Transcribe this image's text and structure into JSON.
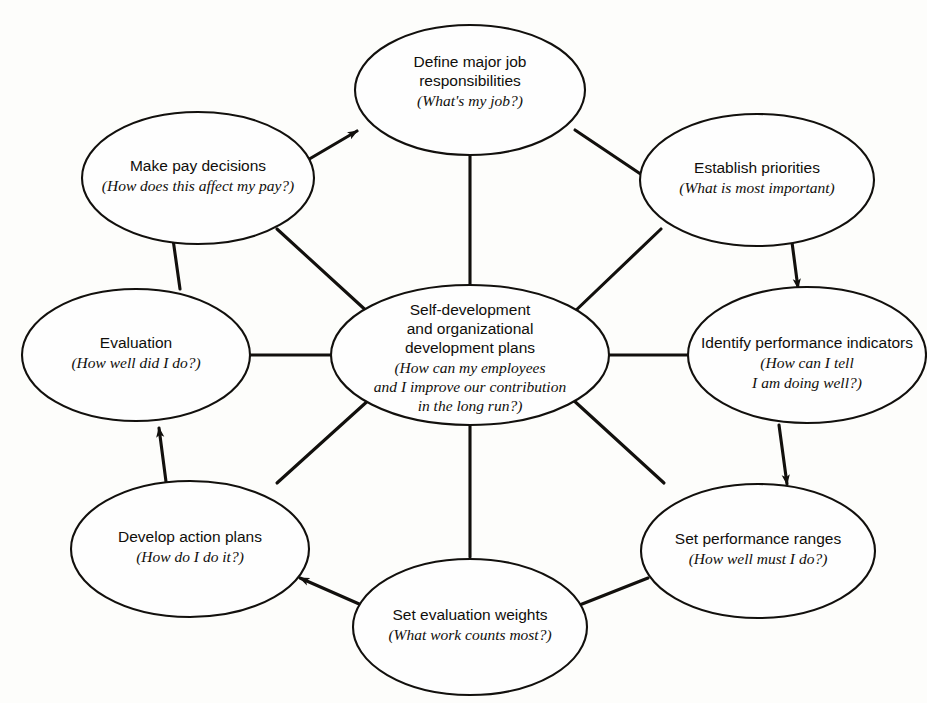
{
  "diagram": {
    "type": "cycle-with-hub",
    "flow_direction": "clockwise",
    "background_color": "#fdfdfb",
    "line_color": "#12100d",
    "hub": {
      "id": "self-development-plans",
      "title_lines": [
        "Self-development",
        "and organizational",
        "development plans"
      ],
      "question_lines": [
        "(How can my employees",
        "and I improve our contribution",
        "in the long run?)"
      ]
    },
    "nodes": [
      {
        "id": "define-major-job-responsibilities",
        "position": "top",
        "title_lines": [
          "Define major job",
          "responsibilities"
        ],
        "question_lines": [
          "(What's my job?)"
        ]
      },
      {
        "id": "establish-priorities",
        "position": "top-right",
        "title_lines": [
          "Establish priorities"
        ],
        "question_lines": [
          "(What is most important)"
        ]
      },
      {
        "id": "identify-performance-indicators",
        "position": "right",
        "title_lines": [
          "Identify performance indicators"
        ],
        "question_lines": [
          "(How can I tell",
          "I am doing well?)"
        ]
      },
      {
        "id": "set-performance-ranges",
        "position": "bottom-right",
        "title_lines": [
          "Set performance ranges"
        ],
        "question_lines": [
          "(How well must I do?)"
        ]
      },
      {
        "id": "set-evaluation-weights",
        "position": "bottom",
        "title_lines": [
          "Set evaluation weights"
        ],
        "question_lines": [
          "(What work counts most?)"
        ]
      },
      {
        "id": "develop-action-plans",
        "position": "bottom-left",
        "title_lines": [
          "Develop action plans"
        ],
        "question_lines": [
          "(How do I do it?)"
        ]
      },
      {
        "id": "evaluation",
        "position": "left",
        "title_lines": [
          "Evaluation"
        ],
        "question_lines": [
          "(How well did I do?)"
        ]
      },
      {
        "id": "make-pay-decisions",
        "position": "top-left",
        "title_lines": [
          "Make pay decisions"
        ],
        "question_lines": [
          "(How does this affect my pay?)"
        ]
      }
    ],
    "cycle_edges": [
      {
        "from": "make-pay-decisions",
        "to": "define-major-job-responsibilities",
        "arrow": true
      },
      {
        "from": "define-major-job-responsibilities",
        "to": "establish-priorities",
        "arrow": true
      },
      {
        "from": "establish-priorities",
        "to": "identify-performance-indicators",
        "arrow": true
      },
      {
        "from": "identify-performance-indicators",
        "to": "set-performance-ranges",
        "arrow": true
      },
      {
        "from": "set-performance-ranges",
        "to": "set-evaluation-weights",
        "arrow": true
      },
      {
        "from": "set-evaluation-weights",
        "to": "develop-action-plans",
        "arrow": true
      },
      {
        "from": "develop-action-plans",
        "to": "evaluation",
        "arrow": true
      },
      {
        "from": "evaluation",
        "to": "make-pay-decisions",
        "arrow": true
      }
    ],
    "hub_spokes": [
      {
        "node": "define-major-job-responsibilities",
        "arrow": false
      },
      {
        "node": "establish-priorities",
        "arrow": false
      },
      {
        "node": "identify-performance-indicators",
        "arrow": false
      },
      {
        "node": "set-performance-ranges",
        "arrow": false
      },
      {
        "node": "set-evaluation-weights",
        "arrow": false
      },
      {
        "node": "develop-action-plans",
        "arrow": false
      },
      {
        "node": "evaluation",
        "arrow": false
      },
      {
        "node": "make-pay-decisions",
        "arrow": false
      }
    ]
  }
}
